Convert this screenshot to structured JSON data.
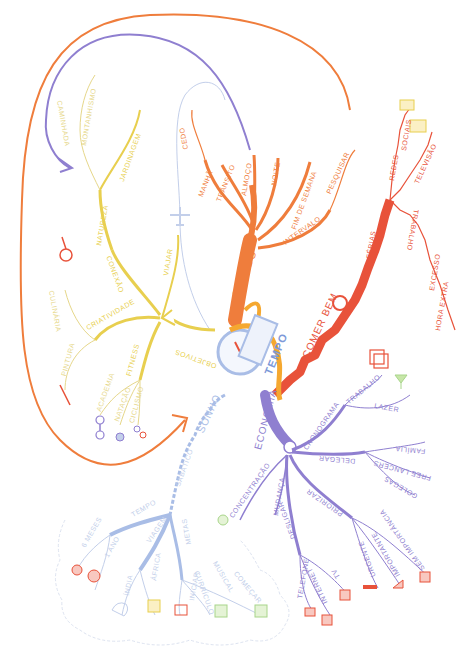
{
  "mindmap": {
    "central_topic": "TEMPO",
    "branches": {
      "quando": {
        "label": "QUANDO",
        "color": "#ef7d3c",
        "children": [
          "MANHÃ",
          "TRÂNSITO",
          "ALMOÇO",
          "NOITE",
          "FIM DE SEMANA",
          "INTERVALO",
          "PESQUISAR",
          "CEDO"
        ]
      },
      "comer_bem": {
        "label": "COMER BEM",
        "color": "#e8523a",
        "children": [
          "FÉRIAS",
          "TRABALHO",
          "REDES",
          "SOCIAIS",
          "TELEVISÃO",
          "EXCESSO",
          "HORA EXTRA"
        ]
      },
      "economia": {
        "label": "ECONOMIA",
        "color": "#8f7fd0",
        "children": [
          "CRONOGRAMA",
          "TRABALHO",
          "LAZER",
          "DELEGAR",
          "FAMÍLIA",
          "FREE LANCERS",
          "COLEGAS",
          "PRIORIZAR",
          "SEM IMPORTÂNCIA",
          "IMPORTANTE",
          "URGENTE",
          "TV",
          "INTERNET",
          "TELEFONE",
          "DESLIGAR",
          "MUDANÇA",
          "CONCENTRAÇÃO"
        ]
      },
      "sonho": {
        "label": "SONHO",
        "color": "#a9bde6",
        "children": [
          "SABÁTICO",
          "TEMPO",
          "6 MESES",
          "1 ANO",
          "VIAGEM",
          "ÍNDIA",
          "ÁFRICA",
          "METAS",
          "INICIAR",
          "CURRÍCULO",
          "MUSICAL",
          "COMEÇAR"
        ]
      },
      "objetivos": {
        "label": "OBJETIVOS",
        "color": "#e8cf4f",
        "children": [
          "CRIATIVIDADE",
          "PINTURA",
          "CULINÁRIA",
          "FITNESS",
          "ACADEMIA",
          "NATAÇÃO",
          "CICLISMO",
          "CONEXÃO",
          "NATUREZA",
          "JARDINAGEM",
          "MONTANHISMO",
          "CAMINHADA",
          "VIAJAR"
        ]
      }
    },
    "labels": {
      "quando": "QUANDO",
      "manha": "MANHÃ",
      "transito": "TRÂNSITO",
      "almoco": "ALMOÇO",
      "noite": "NOITE",
      "fim_semana": "FIM DE SEMANA",
      "intervalo": "INTERVALO",
      "pesquisar": "PESQUISAR",
      "cedo": "CEDO",
      "comer_bem": "COMER BEM",
      "ferias": "FÉRIAS",
      "trabalho_r": "TRABALHO",
      "redes": "REDES",
      "sociais": "SOCIAIS",
      "televisao": "TELEVISÃO",
      "excesso": "EXCESSO",
      "hora_extra": "HORA EXTRA",
      "economia": "ECONOMIA",
      "cronograma": "CRONOGRAMA",
      "trabalho_p": "TRABALHO",
      "lazer": "LAZER",
      "delegar": "DELEGAR",
      "familia": "FAMÍLIA",
      "free_lancers": "FREE LANCERS",
      "colegas": "COLEGAS",
      "priorizar": "PRIORIZAR",
      "sem_importancia": "SEM IMPORTÂNCIA",
      "importante": "IMPORTANTE",
      "urgente": "URGENTE",
      "tv": "TV",
      "internet": "INTERNET",
      "telefone": "TELEFONE",
      "desligar": "DESLIGAR",
      "mudanca": "MUDANÇA",
      "concentracao": "CONCENTRAÇÃO",
      "sonho": "SONHO",
      "sabatico": "SABÁTICO",
      "tempo": "TEMPO",
      "seis_meses": "6 MESES",
      "um_ano": "1 ANO",
      "viagem": "VIAGEM",
      "india": "ÍNDIA",
      "africa": "ÁFRICA",
      "metas": "METAS",
      "iniciar": "INICIAR",
      "curriculo": "CURRÍCULO",
      "musical": "MUSICAL",
      "comecar": "COMEÇAR",
      "objetivos": "OBJETIVOS",
      "criatividade": "CRIATIVIDADE",
      "pintura": "PINTURA",
      "culinaria": "CULINÁRIA",
      "fitness": "FITNESS",
      "academia": "ACADEMIA",
      "natacao": "NATAÇÃO",
      "ciclismo": "CICLISMO",
      "conexao": "CONEXÃO",
      "natureza": "NATUREZA",
      "jardinagem": "JARDINAGEM",
      "montanhismo": "MONTANHISMO",
      "caminhada": "CAMINHADA",
      "viajar": "VIAJAR"
    }
  }
}
